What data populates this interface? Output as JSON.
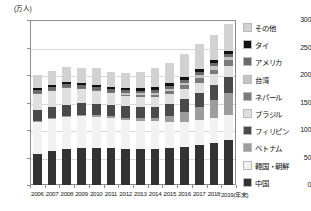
{
  "chart": {
    "unit_label": "(万人)",
    "x_axis_note": "(年末)"
  },
  "chart_data": {
    "type": "bar",
    "title": "",
    "subtitle": "",
    "xlabel": "(年末)",
    "ylabel": "(万人)",
    "stacked": true,
    "grid": true,
    "legend_position": "right",
    "ylim": [
      0,
      300
    ],
    "yticks": [
      0,
      50,
      100,
      150,
      200,
      250,
      300
    ],
    "ytick_labels": [
      "0",
      "50",
      "100",
      "150",
      "200",
      "250",
      "300"
    ],
    "categories": [
      "2006",
      "2007",
      "2008",
      "2009",
      "2010",
      "2011",
      "2012",
      "2013",
      "2014",
      "2015",
      "2016",
      "2017",
      "2018",
      "2019"
    ],
    "category_labels": [
      "2006",
      "2007",
      "2008",
      "2009",
      "2010",
      "2011",
      "2012",
      "2013",
      "2014",
      "2015",
      "2016",
      "2017",
      "2018",
      "2019(年末)"
    ],
    "series": [
      {
        "name": "中国",
        "color": "#333333",
        "values": [
          56,
          61,
          65,
          68,
          68,
          67.5,
          65.5,
          65.5,
          65.5,
          67,
          69.5,
          73,
          76,
          81
        ]
      },
      {
        "name": "韓国・朝鮮",
        "color": "#f2f2f2",
        "values": [
          60,
          59,
          58,
          57,
          56,
          54.5,
          53,
          51.5,
          50,
          47,
          45.5,
          45,
          45,
          45.5
        ]
      },
      {
        "name": "ベトナム",
        "color": "#9d9d9d",
        "values": [
          1,
          1.5,
          2,
          2.5,
          3,
          3.5,
          4,
          4.5,
          6,
          11.5,
          17.5,
          23,
          33,
          41
        ]
      },
      {
        "name": "フィリピン",
        "color": "#4a4a4a",
        "values": [
          19,
          20,
          21,
          21,
          21,
          20.5,
          20.5,
          21,
          21,
          22,
          24,
          26,
          27,
          28
        ]
      },
      {
        "name": "ブラジル",
        "color": "#e0e0e0",
        "values": [
          31,
          31,
          31,
          27,
          23,
          21,
          19,
          18,
          17.5,
          17.5,
          18,
          19,
          20,
          21
        ]
      },
      {
        "name": "ネパール",
        "color": "#7a7a7a",
        "values": [
          0.6,
          0.8,
          1.2,
          1.5,
          2,
          2.5,
          2.5,
          3,
          4,
          5.5,
          6.5,
          8,
          9,
          10
        ]
      },
      {
        "name": "台湾",
        "color": "#c4c4c4",
        "values": [
          0,
          0,
          0,
          0,
          0,
          0,
          2.5,
          3.3,
          4,
          4.8,
          5.2,
          5.6,
          6,
          6.5
        ]
      },
      {
        "name": "アメリカ",
        "color": "#6b6b6b",
        "values": [
          5,
          5.1,
          5.2,
          5.1,
          5,
          5,
          4.9,
          5,
          5.1,
          5.2,
          5.4,
          5.6,
          5.8,
          6
        ]
      },
      {
        "name": "タイ",
        "color": "#111111",
        "values": [
          4,
          4.1,
          4.2,
          4.2,
          4.2,
          4.2,
          4,
          4.1,
          4.3,
          4.5,
          4.7,
          5,
          5.2,
          5.5
        ]
      },
      {
        "name": "その他",
        "color": "#d2d2d2",
        "values": [
          23.4,
          25.5,
          26.4,
          26.7,
          30.8,
          26.3,
          28.1,
          30.1,
          34.6,
          36,
          42.7,
          45.8,
          45,
          48.5
        ]
      }
    ],
    "legend_order_top_to_bottom": [
      "その他",
      "タイ",
      "アメリカ",
      "台湾",
      "ネパール",
      "ブラジル",
      "フィリピン",
      "ベトナム",
      "韓国・朝鮮",
      "中国"
    ],
    "totals": [
      200,
      208,
      214,
      213,
      213,
      205,
      204,
      206,
      212,
      221,
      238,
      256,
      272,
      293
    ]
  }
}
